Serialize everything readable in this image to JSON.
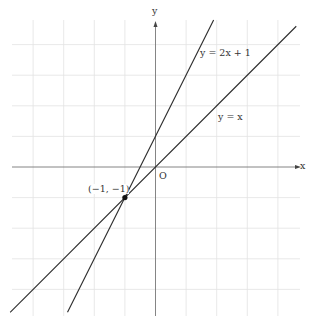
{
  "chart_data": {
    "type": "line",
    "title": "",
    "xlabel": "x",
    "ylabel": "y",
    "origin_label": "O",
    "xlim": [
      -4.75,
      4.75
    ],
    "ylim": [
      -4.75,
      4.75
    ],
    "grid": true,
    "grid_step": 1,
    "series": [
      {
        "name": "y = 2x + 1",
        "slope": 2,
        "intercept": 1,
        "x": [
          -2.875,
          1.9
        ],
        "y": [
          -4.75,
          4.8
        ]
      },
      {
        "name": "y = x",
        "slope": 1,
        "intercept": 0,
        "x": [
          -4.75,
          4.6
        ],
        "y": [
          -4.75,
          4.6
        ]
      }
    ],
    "points": [
      {
        "label": "(−1, −1)",
        "x": -1,
        "y": -1
      }
    ]
  },
  "labels": {
    "x_axis": "x",
    "y_axis": "y",
    "origin": "O",
    "line1": "y = 2x + 1",
    "line2": "y = x",
    "intersection": "(−1, −1)"
  },
  "colors": {
    "grid": "#e2e2e2",
    "axis": "#777777",
    "line": "#2b2b2b"
  }
}
